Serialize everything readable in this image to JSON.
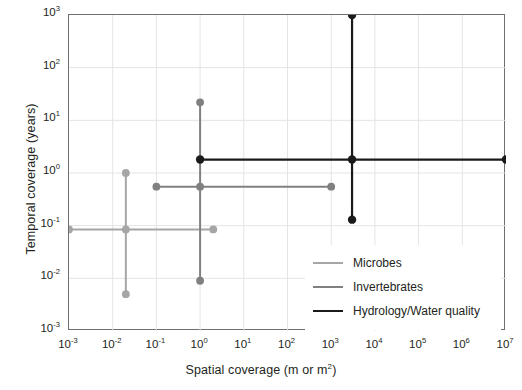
{
  "chart_data": {
    "type": "scatter",
    "title": "",
    "xlabel": "Spatial coverage (m or m²)",
    "ylabel": "Temporal coverage (years)",
    "xscale": "log",
    "yscale": "log",
    "xlim": [
      0.001,
      10000000
    ],
    "ylim": [
      0.001,
      1000
    ],
    "grid": true,
    "legend_position": "inside-lower-right",
    "xticks": [
      {
        "value": 0.001,
        "label": "10",
        "exponent": "-3"
      },
      {
        "value": 0.01,
        "label": "10",
        "exponent": "-2"
      },
      {
        "value": 0.1,
        "label": "10",
        "exponent": "-1"
      },
      {
        "value": 1,
        "label": "10",
        "exponent": "0"
      },
      {
        "value": 10,
        "label": "10",
        "exponent": "1"
      },
      {
        "value": 100,
        "label": "10",
        "exponent": "2"
      },
      {
        "value": 1000,
        "label": "10",
        "exponent": "3"
      },
      {
        "value": 10000,
        "label": "10",
        "exponent": "4"
      },
      {
        "value": 100000,
        "label": "10",
        "exponent": "5"
      },
      {
        "value": 1000000,
        "label": "10",
        "exponent": "6"
      },
      {
        "value": 10000000,
        "label": "10",
        "exponent": "7"
      }
    ],
    "yticks": [
      {
        "value": 1000,
        "label": "10",
        "exponent": "3"
      },
      {
        "value": 100,
        "label": "10",
        "exponent": "2"
      },
      {
        "value": 10,
        "label": "10",
        "exponent": "1"
      },
      {
        "value": 1,
        "label": "10",
        "exponent": "0"
      },
      {
        "value": 0.1,
        "label": "10",
        "exponent": "-1"
      },
      {
        "value": 0.01,
        "label": "10",
        "exponent": "-2"
      },
      {
        "value": 0.001,
        "label": "10",
        "exponent": "-3"
      }
    ],
    "series": [
      {
        "name": "Microbes",
        "color": "#a6a6a6",
        "center": {
          "x": 0.02,
          "y": 0.085
        },
        "x_range": [
          0.001,
          2.0
        ],
        "y_range": [
          0.005,
          1.0
        ],
        "markers": [
          {
            "x": 0.001,
            "y": 0.085
          },
          {
            "x": 2.0,
            "y": 0.085
          },
          {
            "x": 0.02,
            "y": 0.085
          },
          {
            "x": 0.02,
            "y": 1.0
          },
          {
            "x": 0.02,
            "y": 0.005
          }
        ]
      },
      {
        "name": "Invertebrates",
        "color": "#808080",
        "center": {
          "x": 1.0,
          "y": 0.55
        },
        "x_range": [
          0.1,
          1000.0
        ],
        "y_range": [
          0.009,
          22.0
        ],
        "markers": [
          {
            "x": 0.1,
            "y": 0.55
          },
          {
            "x": 1000.0,
            "y": 0.55
          },
          {
            "x": 1.0,
            "y": 0.55
          },
          {
            "x": 1.0,
            "y": 22.0
          },
          {
            "x": 1.0,
            "y": 0.009
          }
        ]
      },
      {
        "name": "Hydrology/Water quality",
        "color": "#1a1a1a",
        "center": {
          "x": 3000.0,
          "y": 1.8
        },
        "x_range": [
          1.0,
          10000000.0
        ],
        "y_range": [
          0.13,
          1000.0
        ],
        "markers": [
          {
            "x": 1.0,
            "y": 1.8
          },
          {
            "x": 10000000.0,
            "y": 1.8
          },
          {
            "x": 3000.0,
            "y": 1.8
          },
          {
            "x": 3000.0,
            "y": 1000.0
          },
          {
            "x": 3000.0,
            "y": 0.13
          }
        ]
      }
    ]
  },
  "legend": {
    "items": [
      {
        "label": "Microbes",
        "color": "#a6a6a6",
        "width": 2.2
      },
      {
        "label": "Invertebrates",
        "color": "#808080",
        "width": 2.2
      },
      {
        "label": "Hydrology/Water quality",
        "color": "#1a1a1a",
        "width": 2.6
      }
    ]
  },
  "style": {
    "grid_color": "#e4e4e4",
    "frame_color": "#6f6f6f",
    "background": "#ffffff",
    "text_color": "#231f20"
  }
}
